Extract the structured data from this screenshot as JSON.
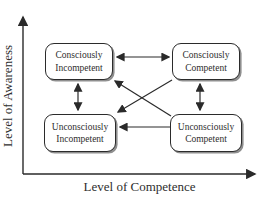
{
  "diagram": {
    "x_axis_label": "Level of Competence",
    "y_axis_label": "Level of Awareness",
    "boxes": [
      {
        "id": "consciously-incompetent",
        "label": "Consciously Incompetent",
        "quadrant": "top-left"
      },
      {
        "id": "consciously-competent",
        "label": "Consciously Competent",
        "quadrant": "top-right"
      },
      {
        "id": "unconsciously-incompetent",
        "label": "Unconsciously Incompetent",
        "quadrant": "bottom-left"
      },
      {
        "id": "unconsciously-competent",
        "label": "Unconsciously Competent",
        "quadrant": "bottom-right"
      }
    ],
    "arrows": [
      {
        "from": "consciously-incompetent",
        "to": "consciously-competent",
        "bidirectional": true
      },
      {
        "from": "consciously-incompetent",
        "to": "unconsciously-incompetent",
        "bidirectional": true
      },
      {
        "from": "consciously-competent",
        "to": "unconsciously-competent",
        "bidirectional": true
      },
      {
        "from": "unconsciously-competent",
        "to": "unconsciously-incompetent",
        "bidirectional": false
      },
      {
        "from": "unconsciously-competent",
        "to": "consciously-incompetent",
        "bidirectional": false
      },
      {
        "from": "consciously-competent",
        "to": "unconsciously-incompetent",
        "bidirectional": false
      }
    ],
    "colors": {
      "line": "#2a2a2a",
      "box_border": "#2b2b2b",
      "box_fill": "#ffffff",
      "box_shadow": "#8f8f8f",
      "text": "#2e2e2e",
      "background": "#ffffff"
    }
  }
}
